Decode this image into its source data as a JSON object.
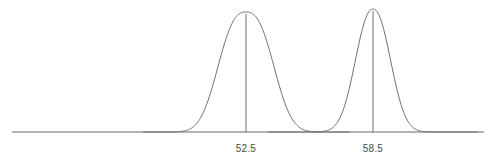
{
  "figure": {
    "title": "",
    "background_color": "#ffffff",
    "width": 496,
    "height": 163
  },
  "axis": {
    "name": "horizontal-axis",
    "color": "#9a9a9a",
    "x_start": 12,
    "x_end": 484,
    "y": 132,
    "stroke_width": 1.6
  },
  "style": {
    "curve_color": "#6e6e6e",
    "center_line_color": "#6e6e6e",
    "label_color": "#4a4a4a",
    "label_font_size": 10,
    "curve_stroke_width": 1
  },
  "labels": {
    "left_tick": "52.5",
    "right_tick": "58.5",
    "label_baseline_y": 152
  },
  "chart_data": {
    "type": "line",
    "title": "",
    "subtitle": "",
    "xlabel": "",
    "ylabel": "",
    "grid": false,
    "legend": false,
    "legend_position": "none",
    "axis_ranges": {
      "x_pixel_range": [
        12,
        484
      ],
      "y_pixel_baseline": 132,
      "y_pixel_top": 9
    },
    "tick_labels": [
      "52.5",
      "58.5"
    ],
    "curves": [
      {
        "name": "wide-distribution",
        "label": "52.5",
        "mean_label": "52.5",
        "center_x": 246,
        "peak_y": 12,
        "sigma_px": 26,
        "flatness": 2.6,
        "tail_start_x": 143,
        "tail_end_x": 350,
        "relative_height": 0.94,
        "relative_width": "wide",
        "peak_shape": "broad flat-topped"
      },
      {
        "name": "narrow-distribution",
        "label": "58.5",
        "mean_label": "58.5",
        "center_x": 373,
        "peak_y": 9,
        "sigma_px": 17,
        "flatness": 2.2,
        "tail_start_x": 268,
        "tail_end_x": 478,
        "relative_height": 1.0,
        "relative_width": "narrow",
        "peak_shape": "narrow rounded"
      }
    ],
    "intersection": {
      "x": 310,
      "y": 127,
      "note": "the two curve tails cross just above the baseline between the two peaks"
    }
  }
}
